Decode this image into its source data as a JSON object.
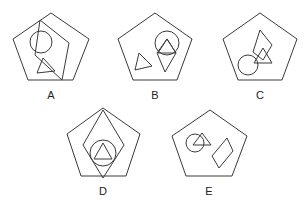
{
  "figures": [
    {
      "id": "A",
      "label": "A",
      "label_pos": [
        51,
        90
      ],
      "pentagon": "51,13 89,39 73,80 28,80 13,39",
      "extra_quad": "40,20 69,43 62,80 35,55",
      "circle": {
        "cx": 41,
        "cy": 42,
        "r": 11
      },
      "triangles": [
        "43,58 37,73 55,71"
      ],
      "diamonds": []
    },
    {
      "id": "B",
      "label": "B",
      "label_pos": [
        155,
        90
      ],
      "pentagon": "155,13 192,39 177,80 133,80 118,39",
      "circle": {
        "cx": 167,
        "cy": 43,
        "r": 12
      },
      "triangles": [
        "167,39 158,53 176,53",
        "139,53 135,70 152,66"
      ],
      "diamonds": [
        "167,39 176,53 165,72 157,53"
      ]
    },
    {
      "id": "C",
      "label": "C",
      "label_pos": [
        260,
        90
      ],
      "pentagon": "260,13 297,39 282,80 238,80 223,39",
      "circle": {
        "cx": 248,
        "cy": 65,
        "r": 10
      },
      "triangles": [
        "263,48 254,63 272,63"
      ],
      "diamonds": [
        "260,30 272,45 263,60 253,52"
      ]
    },
    {
      "id": "D",
      "label": "D",
      "label_pos": [
        103,
        186
      ],
      "pentagon": "103,108 140,134 126,176 81,176 67,134",
      "circle": {
        "cx": 103,
        "cy": 153,
        "r": 13
      },
      "triangles": [
        "103,143 94,159 112,159"
      ],
      "diamonds": [
        "103,110 124,145 103,178 83,145"
      ]
    },
    {
      "id": "E",
      "label": "E",
      "label_pos": [
        209,
        186
      ],
      "pentagon": "210,110 247,136 232,176 186,176 172,136",
      "circle": {
        "cx": 195,
        "cy": 143,
        "r": 9
      },
      "triangles": [
        "202,133 193,145 211,145"
      ],
      "diamonds": [
        "227,138 233,151 219,168 212,156"
      ]
    }
  ]
}
